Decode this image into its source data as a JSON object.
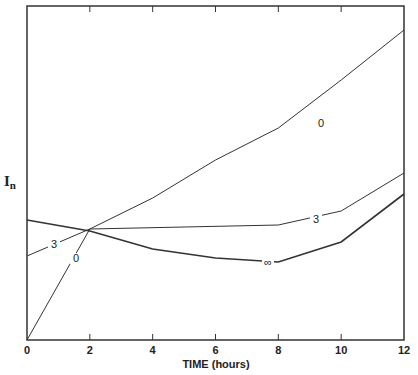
{
  "chart_data": {
    "type": "line",
    "title": "",
    "xlabel": "TIME (hours)",
    "ylabel": "I_n",
    "ylabel_display": "I",
    "ylabel_sub": "n",
    "x_ticks": [
      "0",
      "2",
      "4",
      "6",
      "8",
      "10",
      "12"
    ],
    "xlim": [
      0,
      12
    ],
    "grid": false,
    "legend": "inline curve labels",
    "series": [
      {
        "name": "0",
        "label": "0",
        "x": [
          0,
          2,
          4,
          6,
          8,
          10,
          12
        ],
        "y_px": [
          340,
          229,
          198,
          160,
          128,
          80,
          30
        ]
      },
      {
        "name": "3",
        "label": "3",
        "x": [
          0,
          2,
          8,
          10,
          12
        ],
        "y_px": [
          256,
          229,
          225,
          211,
          173
        ]
      },
      {
        "name": "infinity",
        "label": "∞",
        "x": [
          0,
          2,
          4,
          6,
          8,
          10,
          12
        ],
        "y_px": [
          220,
          231,
          249,
          258,
          262,
          242,
          194
        ]
      }
    ]
  }
}
